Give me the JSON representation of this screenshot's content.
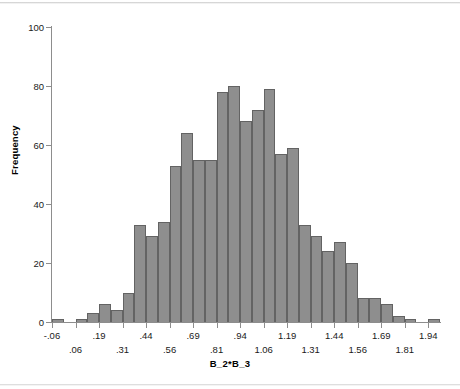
{
  "chart_data": {
    "type": "bar",
    "title": "",
    "subtitle": "",
    "xlabel": "B_2*B_3",
    "ylabel": "Frequency",
    "ylim": [
      0,
      100
    ],
    "yticks": [
      0,
      20,
      40,
      60,
      80,
      100
    ],
    "ytick_labels": [
      "0",
      "20",
      "40",
      "60",
      "80",
      "100"
    ],
    "grid": false,
    "legend": null,
    "bin_width": 0.0625,
    "xtick_labels": [
      "-.06",
      ".06",
      ".19",
      ".31",
      ".44",
      ".56",
      ".69",
      ".81",
      ".94",
      "1.06",
      "1.19",
      "1.31",
      "1.44",
      "1.56",
      "1.69",
      "1.81",
      "1.94"
    ],
    "xtick_values": [
      -0.06,
      0.06,
      0.19,
      0.31,
      0.44,
      0.56,
      0.69,
      0.81,
      0.94,
      1.06,
      1.19,
      1.31,
      1.44,
      1.56,
      1.69,
      1.81,
      1.94
    ],
    "xtick_rows": [
      0,
      1,
      0,
      1,
      0,
      1,
      0,
      1,
      0,
      1,
      0,
      1,
      0,
      1,
      0,
      1,
      0
    ],
    "categories": [
      "-0.06",
      "0.00",
      "0.06",
      "0.13",
      "0.19",
      "0.25",
      "0.31",
      "0.38",
      "0.44",
      "0.50",
      "0.56",
      "0.63",
      "0.69",
      "0.75",
      "0.81",
      "0.88",
      "0.94",
      "1.00",
      "1.06",
      "1.13",
      "1.19",
      "1.25",
      "1.31",
      "1.38",
      "1.44",
      "1.50",
      "1.56",
      "1.63",
      "1.69",
      "1.75",
      "1.81",
      "1.88",
      "1.94"
    ],
    "values": [
      1,
      0,
      1,
      3,
      6,
      4,
      10,
      33,
      29,
      34,
      53,
      64,
      55,
      55,
      78,
      80,
      68,
      72,
      79,
      57,
      59,
      33,
      29,
      24,
      27,
      20,
      8,
      8,
      6,
      2,
      1,
      0,
      1
    ],
    "bar_color": "#8e8e8e",
    "bar_edge_color": "#636363",
    "axis_color": "#8d8d8d",
    "background": "#ffffff"
  }
}
